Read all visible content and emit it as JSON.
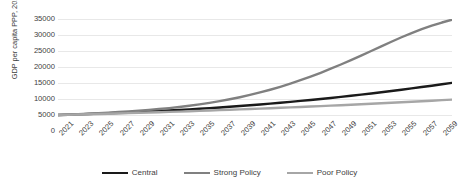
{
  "chart_data": {
    "type": "line",
    "title": "",
    "xlabel": "",
    "ylabel": "GDP per capita PPP, 2018 prices",
    "ylim": [
      0,
      35000
    ],
    "ytick_values": [
      0,
      5000,
      10000,
      15000,
      20000,
      25000,
      30000,
      35000
    ],
    "ytick_labels": [
      "0",
      "5000",
      "10000",
      "15000",
      "20000",
      "25000",
      "30000",
      "35000"
    ],
    "grid": true,
    "legend_position": "bottom",
    "x": [
      2021,
      2022,
      2023,
      2024,
      2025,
      2026,
      2027,
      2028,
      2029,
      2030,
      2031,
      2032,
      2033,
      2034,
      2035,
      2036,
      2037,
      2038,
      2039,
      2040,
      2041,
      2042,
      2043,
      2044,
      2045,
      2046,
      2047,
      2048,
      2049,
      2050,
      2051,
      2052,
      2053,
      2054,
      2055,
      2056,
      2057,
      2058,
      2059,
      2060
    ],
    "xtick_labels": [
      "2021",
      "2023",
      "2025",
      "2027",
      "2029",
      "2031",
      "2033",
      "2035",
      "2037",
      "2039",
      "2041",
      "2043",
      "2045",
      "2047",
      "2049",
      "2051",
      "2053",
      "2055",
      "2057",
      "2059"
    ],
    "series": [
      {
        "name": "Central",
        "color": "#1a1a1a",
        "values": [
          5000,
          5100,
          5210,
          5320,
          5440,
          5560,
          5690,
          5820,
          5960,
          6100,
          6250,
          6410,
          6580,
          6760,
          6950,
          7150,
          7360,
          7580,
          7810,
          8050,
          8300,
          8560,
          8830,
          9110,
          9400,
          9700,
          10010,
          10330,
          10660,
          11000,
          11360,
          11730,
          12110,
          12500,
          12900,
          13310,
          13730,
          14160,
          14600,
          15050
        ]
      },
      {
        "name": "Strong Policy",
        "color": "#808080",
        "values": [
          5000,
          5130,
          5270,
          5420,
          5580,
          5750,
          5930,
          6130,
          6350,
          6590,
          6860,
          7160,
          7500,
          7880,
          8310,
          8790,
          9320,
          9910,
          10560,
          11270,
          12050,
          12900,
          13820,
          14810,
          15870,
          17000,
          18200,
          19460,
          20780,
          22150,
          23560,
          25000,
          26450,
          27900,
          29300,
          30600,
          31800,
          32900,
          33900,
          34800
        ]
      },
      {
        "name": "Poor Policy",
        "color": "#a6a6a6",
        "values": [
          5000,
          5070,
          5145,
          5225,
          5310,
          5395,
          5485,
          5575,
          5670,
          5765,
          5865,
          5965,
          6070,
          6175,
          6285,
          6395,
          6510,
          6625,
          6745,
          6865,
          6990,
          7115,
          7245,
          7375,
          7510,
          7645,
          7785,
          7925,
          8070,
          8215,
          8365,
          8515,
          8670,
          8825,
          8985,
          9145,
          9310,
          9475,
          9645,
          9815
        ]
      }
    ]
  },
  "legend": {
    "items": [
      {
        "label": "Central"
      },
      {
        "label": "Strong Policy"
      },
      {
        "label": "Poor Policy"
      }
    ]
  }
}
